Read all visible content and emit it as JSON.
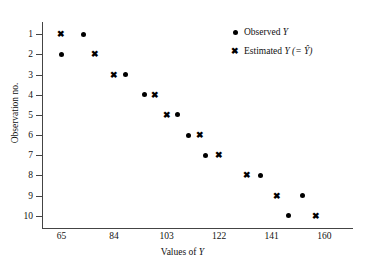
{
  "chart_data": {
    "type": "scatter",
    "title": "",
    "xlabel": "Values of Y",
    "ylabel": "Observation no.",
    "xlim": [
      58,
      170
    ],
    "ylim": [
      0.4,
      10.6
    ],
    "xticks": [
      65,
      84,
      103,
      122,
      141,
      160
    ],
    "xtick_labels": [
      "65",
      "84",
      "103",
      "122",
      "141",
      "160"
    ],
    "yticks": [
      1,
      2,
      3,
      4,
      5,
      6,
      7,
      8,
      9,
      10
    ],
    "ytick_labels": [
      "1",
      "2",
      "3",
      "4",
      "5",
      "6",
      "7",
      "8",
      "9",
      "10"
    ],
    "grid": false,
    "y_axis_inverted": true,
    "legend_position": "top-right",
    "series": [
      {
        "name": "Observed Y",
        "marker": "filled-circle",
        "color": "#000000",
        "observations": [
          1,
          2,
          3,
          4,
          5,
          6,
          7,
          8,
          9,
          10
        ],
        "values": [
          73,
          65,
          88,
          95,
          107,
          111,
          117,
          137,
          152,
          147
        ]
      },
      {
        "name": "Estimated Y (= Ŷ)",
        "marker": "cross",
        "color": "#000000",
        "observations": [
          1,
          2,
          3,
          4,
          5,
          6,
          7,
          8,
          9,
          10
        ],
        "values": [
          65,
          77,
          84,
          99,
          103,
          115,
          122,
          132,
          143,
          157
        ]
      }
    ]
  },
  "axes": {
    "x_title_prefix": "Values of ",
    "x_title_var": "Y",
    "y_title": "Observation no."
  },
  "legend": {
    "items": [
      {
        "symbol": "filled-circle",
        "prefix": "Observed ",
        "var": "Y",
        "suffix": ""
      },
      {
        "symbol": "cross",
        "prefix": "Estimated ",
        "var": "Y",
        "suffix": " (= Ŷ)"
      }
    ]
  }
}
